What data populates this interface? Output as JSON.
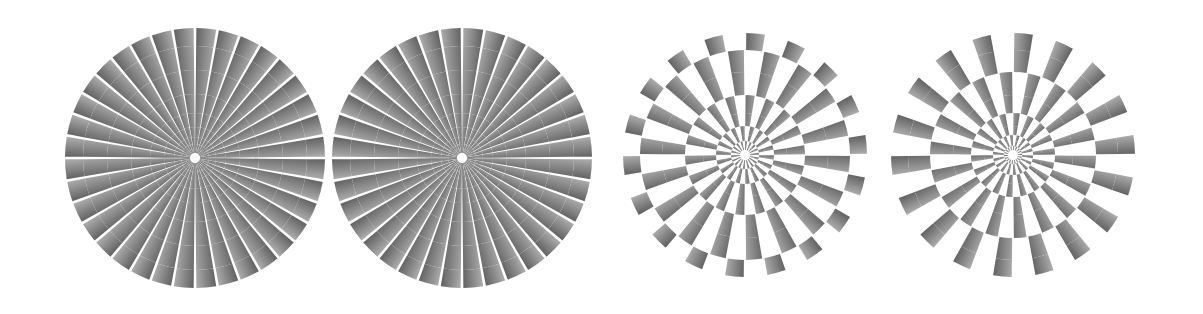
{
  "canvas": {
    "width": 1203,
    "height": 314,
    "background": "#ffffff",
    "title": "Pinna-Brelstaff rotating illusion variants"
  },
  "palette": {
    "background": "#ffffff",
    "cell_dark": "#1c1c1c",
    "cell_light": "#f2f2f2",
    "cell_mid": "#8a8a8a",
    "stroke": "none"
  },
  "geometry": {
    "ring_count": 9,
    "sectors_per_ring": 36,
    "inner_radius_fraction": 0.042,
    "outer_radius_fraction": 1.0,
    "ring_growth": 1.33,
    "sector_twist_degrees": 5.0
  },
  "figures": [
    {
      "id": "figure-1",
      "label": "Figure 1",
      "variant": "solid-tiled",
      "mirrored": false,
      "center_x": 195,
      "center_y": 158,
      "radius": 130,
      "left": 65,
      "width": 260,
      "gradient_angle": -40,
      "checker": false,
      "rings": [
        {
          "index": 0,
          "r_inner": 5,
          "r_outer": 9
        },
        {
          "index": 1,
          "r_inner": 9,
          "r_outer": 14
        },
        {
          "index": 2,
          "r_inner": 14,
          "r_outer": 21
        },
        {
          "index": 3,
          "r_inner": 21,
          "r_outer": 31
        },
        {
          "index": 4,
          "r_inner": 31,
          "r_outer": 45
        },
        {
          "index": 5,
          "r_inner": 45,
          "r_outer": 64
        },
        {
          "index": 6,
          "r_inner": 64,
          "r_outer": 88
        },
        {
          "index": 7,
          "r_inner": 88,
          "r_outer": 112
        },
        {
          "index": 8,
          "r_inner": 112,
          "r_outer": 130
        }
      ]
    },
    {
      "id": "figure-2",
      "label": "Figure 2",
      "variant": "solid-tiled",
      "mirrored": true,
      "center_x": 462,
      "center_y": 158,
      "radius": 130,
      "left": 332,
      "width": 260,
      "gradient_angle": 40,
      "checker": false,
      "rings": [
        {
          "index": 0,
          "r_inner": 5,
          "r_outer": 9
        },
        {
          "index": 1,
          "r_inner": 9,
          "r_outer": 14
        },
        {
          "index": 2,
          "r_inner": 14,
          "r_outer": 21
        },
        {
          "index": 3,
          "r_inner": 21,
          "r_outer": 31
        },
        {
          "index": 4,
          "r_inner": 31,
          "r_outer": 45
        },
        {
          "index": 5,
          "r_inner": 45,
          "r_outer": 64
        },
        {
          "index": 6,
          "r_inner": 64,
          "r_outer": 88
        },
        {
          "index": 7,
          "r_inner": 88,
          "r_outer": 112
        },
        {
          "index": 8,
          "r_inner": 112,
          "r_outer": 130
        }
      ]
    },
    {
      "id": "figure-3",
      "label": "Figure 3",
      "variant": "checker-gapped",
      "mirrored": false,
      "center_x": 745,
      "center_y": 155,
      "radius": 122,
      "left": 623,
      "width": 244,
      "gradient_angle": -40,
      "checker": true,
      "rings": [
        {
          "index": 0,
          "r_inner": 5,
          "r_outer": 9
        },
        {
          "index": 1,
          "r_inner": 9,
          "r_outer": 14
        },
        {
          "index": 2,
          "r_inner": 14,
          "r_outer": 20
        },
        {
          "index": 3,
          "r_inner": 20,
          "r_outer": 29
        },
        {
          "index": 4,
          "r_inner": 29,
          "r_outer": 42
        },
        {
          "index": 5,
          "r_inner": 42,
          "r_outer": 60
        },
        {
          "index": 6,
          "r_inner": 60,
          "r_outer": 83
        },
        {
          "index": 7,
          "r_inner": 83,
          "r_outer": 105
        },
        {
          "index": 8,
          "r_inner": 105,
          "r_outer": 122
        }
      ]
    },
    {
      "id": "figure-4",
      "label": "Figure 4",
      "variant": "checker-gapped",
      "mirrored": true,
      "center_x": 1013,
      "center_y": 155,
      "radius": 122,
      "left": 891,
      "width": 244,
      "gradient_angle": 40,
      "checker": true,
      "rings": [
        {
          "index": 0,
          "r_inner": 5,
          "r_outer": 9
        },
        {
          "index": 1,
          "r_inner": 9,
          "r_outer": 14
        },
        {
          "index": 2,
          "r_inner": 14,
          "r_outer": 20
        },
        {
          "index": 3,
          "r_inner": 20,
          "r_outer": 29
        },
        {
          "index": 4,
          "r_inner": 29,
          "r_outer": 42
        },
        {
          "index": 5,
          "r_inner": 42,
          "r_outer": 60
        },
        {
          "index": 6,
          "r_inner": 60,
          "r_outer": 83
        },
        {
          "index": 7,
          "r_inner": 83,
          "r_outer": 105
        },
        {
          "index": 8,
          "r_inner": 105,
          "r_outer": 122
        }
      ]
    }
  ]
}
